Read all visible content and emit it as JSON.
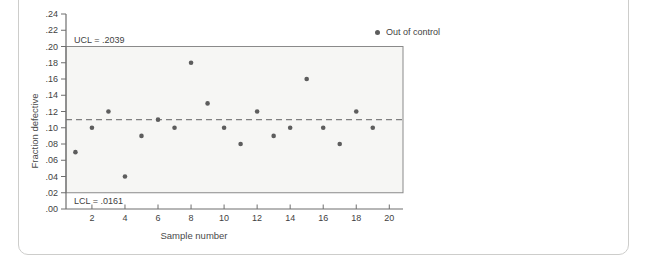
{
  "chart_data": {
    "type": "scatter",
    "subtype": "control-chart",
    "title": "",
    "xlabel": "Sample number",
    "ylabel": "Fraction defective",
    "xlim": [
      0.43,
      20.83
    ],
    "ylim": [
      0,
      0.24
    ],
    "x_ticks": [
      2,
      4,
      6,
      8,
      10,
      12,
      14,
      16,
      18,
      20
    ],
    "x_tick_labels": [
      "2",
      "4",
      "6",
      "8",
      "10",
      "12",
      "14",
      "16",
      "18",
      "20"
    ],
    "y_ticks": [
      0,
      0.02,
      0.04,
      0.06,
      0.08,
      0.1,
      0.12,
      0.14,
      0.16,
      0.18,
      0.2,
      0.22,
      0.24
    ],
    "y_tick_labels": [
      ".00",
      ".02",
      ".04",
      ".06",
      ".08",
      ".10",
      ".12",
      ".14",
      ".16",
      ".18",
      ".20",
      ".22",
      ".24"
    ],
    "grid": false,
    "ucl_label": "UCL = .2039",
    "ucl_value": 0.2039,
    "lcl_label": "LCL = .0161",
    "lcl_value": 0.0161,
    "center_line_value": 0.11,
    "center_line_style": "dashed",
    "band": {
      "bottom": 0.02,
      "top": 0.2
    },
    "legend": [
      {
        "label": "Out of control",
        "marker": "dot"
      }
    ],
    "legend_position": "top-right",
    "series": [
      {
        "name": "Fraction defective by sample",
        "x": [
          1,
          2,
          3,
          4,
          5,
          6,
          7,
          8,
          9,
          10,
          11,
          12,
          13,
          14,
          15,
          16,
          17,
          18,
          19
        ],
        "y": [
          0.07,
          0.1,
          0.12,
          0.04,
          0.09,
          0.11,
          0.1,
          0.18,
          0.13,
          0.1,
          0.08,
          0.12,
          0.09,
          0.1,
          0.16,
          0.1,
          0.08,
          0.12,
          0.1
        ]
      }
    ],
    "colors": {
      "point": "#5d5d5d",
      "band_fill": "#f6f6f4",
      "box_stroke": "#8a8a8a",
      "axis": "#6e6e6e",
      "center_line": "#808080",
      "text": "#3f3f3f",
      "card_border": "#cdcdcb"
    }
  }
}
